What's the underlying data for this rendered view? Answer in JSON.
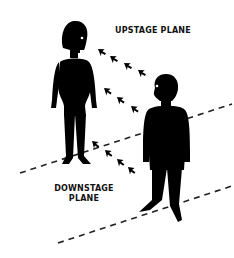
{
  "diagram": {
    "labels": {
      "upstage": "UPSTAGE PLANE",
      "downstage_line1": "DOWNSTAGE",
      "downstage_line2": "PLANE"
    },
    "figures": [
      {
        "name": "woman",
        "plane": "upstage",
        "color": "#000000"
      },
      {
        "name": "man",
        "plane": "downstage",
        "color": "#000000"
      }
    ],
    "gaze_arrows": [
      {
        "from": "man",
        "to": "woman",
        "path": "eye-line",
        "count": 4
      },
      {
        "from": "man",
        "to": "woman",
        "path": "mid",
        "count": 3
      },
      {
        "from": "man",
        "to": "woman",
        "path": "low",
        "count": 4
      }
    ],
    "planes": [
      {
        "name": "upstage-plane-line",
        "style": "dashed"
      },
      {
        "name": "downstage-plane-line",
        "style": "dashed"
      }
    ],
    "colors": {
      "ink": "#000000",
      "background": "#ffffff"
    }
  }
}
